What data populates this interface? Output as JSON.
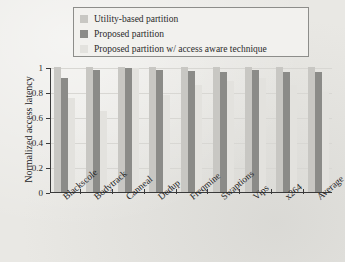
{
  "figure": {
    "background_color": "#e9e8e4",
    "axis_color": "#3a3a3a"
  },
  "legend": {
    "position": "top",
    "border_color": "#8d8d8a",
    "entries": [
      {
        "label": "Utility-based partition",
        "color": "#c8c7c3",
        "swatch_name": "legend-swatch-utility-based"
      },
      {
        "label": "Proposed partition",
        "color": "#8b8b88",
        "swatch_name": "legend-swatch-proposed"
      },
      {
        "label": "Proposed partition w/ access aware technique",
        "color": "#e3e2de",
        "swatch_name": "legend-swatch-access-aware"
      }
    ]
  },
  "chart_data": {
    "type": "bar",
    "title": "",
    "subtitle": "",
    "xlabel": "",
    "ylabel": "Normalized access latency",
    "ylim": [
      0,
      1
    ],
    "yticks": [
      "0",
      "0.2",
      "0.4",
      "0.6",
      "0.8",
      "1"
    ],
    "ytick_values": [
      0,
      0.2,
      0.4,
      0.6,
      0.8,
      1
    ],
    "grid": true,
    "legend_position": "top",
    "categories": [
      "Blackscole",
      "Bodytrack",
      "Canneal",
      "Dedup",
      "Freqmine",
      "Swaptions",
      "Vips",
      "x264",
      "Average"
    ],
    "series": [
      {
        "name": "Utility-based partition",
        "color": "#c8c7c3",
        "values": [
          1.0,
          1.0,
          1.0,
          1.0,
          1.0,
          1.0,
          1.0,
          1.0,
          1.0
        ]
      },
      {
        "name": "Proposed partition",
        "color": "#8b8b88",
        "values": [
          0.91,
          0.98,
          0.99,
          0.98,
          0.97,
          0.96,
          0.98,
          0.96,
          0.96
        ]
      },
      {
        "name": "Proposed partition w/ access aware technique",
        "color": "#e3e2de",
        "values": [
          0.75,
          0.65,
          0.99,
          0.78,
          0.86,
          0.89,
          0.91,
          0.86,
          0.8
        ]
      }
    ]
  }
}
